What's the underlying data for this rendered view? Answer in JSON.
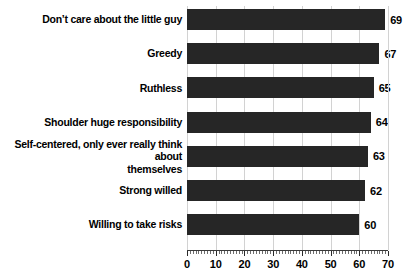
{
  "chart_data": {
    "type": "bar",
    "orientation": "horizontal",
    "title": "",
    "subtitle": "",
    "xlabel": "",
    "ylabel": "",
    "xlim": [
      0,
      70
    ],
    "grid": "vertical major gridlines at every 10 units",
    "legend": "none",
    "bar_color": "#262626",
    "background_color": "#ffffff",
    "gridline_color": "#d2d2d2",
    "categories": [
      "Don’t care about the little guy",
      "Greedy",
      "Ruthless",
      "Shoulder huge responsibility",
      "Self-centered, only ever really think about themselves",
      "Strong willed",
      "Willing to take risks"
    ],
    "values": [
      69,
      67,
      65,
      64,
      63,
      62,
      60
    ],
    "value_labels": [
      "69",
      "67",
      "65",
      "64",
      "63",
      "62",
      "60"
    ],
    "x_ticks": [
      0,
      10,
      20,
      30,
      40,
      50,
      60,
      70
    ],
    "x_tick_labels": [
      "0",
      "10",
      "20",
      "30",
      "40",
      "50",
      "60",
      "70"
    ],
    "minor_tick_interval": 1
  },
  "categories_lines": [
    [
      "Don’t care about the little guy"
    ],
    [
      "Greedy"
    ],
    [
      "Ruthless"
    ],
    [
      "Shoulder huge responsibility"
    ],
    [
      "Self-centered, only ever really think about",
      "themselves"
    ],
    [
      "Strong willed"
    ],
    [
      "Willing to take risks"
    ]
  ]
}
